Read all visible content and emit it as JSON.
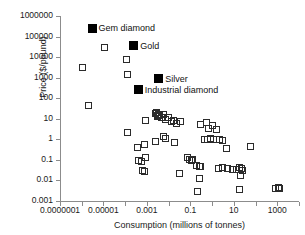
{
  "chart_data": {
    "type": "scatter",
    "title": "",
    "xlabel": "Consumption (millions of tonnes)",
    "ylabel": "Price ($/pound)",
    "xscale": "log",
    "yscale": "log",
    "xlim": [
      1e-07,
      10000
    ],
    "ylim": [
      0.001,
      1000000
    ],
    "grid": false,
    "legend": "none",
    "xticklabels": [
      "0.0000001",
      "0.00001",
      "0.001",
      "0.1",
      "10",
      "1000"
    ],
    "xtickvalues": [
      1e-07,
      1e-05,
      0.001,
      0.1,
      10,
      1000
    ],
    "yticklabels": [
      "1000000",
      "100000",
      "10000",
      "1000",
      "100",
      "10",
      "1",
      "0.1",
      "0.01",
      "0.001"
    ],
    "ytickvalues": [
      1000000,
      100000,
      10000,
      1000,
      100,
      10,
      1,
      0.1,
      0.01,
      0.001
    ],
    "annotations": [
      {
        "label": "Gem diamond",
        "x": 3e-06,
        "y": 250000
      },
      {
        "label": "Gold",
        "x": 0.00025,
        "y": 35000
      },
      {
        "label": "Silver",
        "x": 0.0035,
        "y": 900
      },
      {
        "label": "Industrial diamond",
        "x": 0.0004,
        "y": 260
      }
    ],
    "series": [
      {
        "name": "Labeled commodities",
        "marker": "filled-square",
        "points": [
          {
            "x": 3e-06,
            "y": 250000,
            "label": "Gem diamond"
          },
          {
            "x": 0.00025,
            "y": 35000,
            "label": "Gold"
          },
          {
            "x": 0.0035,
            "y": 900,
            "label": "Silver"
          },
          {
            "x": 0.0004,
            "y": 260,
            "label": "Industrial diamond"
          }
        ]
      },
      {
        "name": "Other commodities",
        "marker": "open-square",
        "points": [
          {
            "x": 1.1e-05,
            "y": 30000
          },
          {
            "x": 1.1e-06,
            "y": 3200
          },
          {
            "x": 0.00012,
            "y": 7500
          },
          {
            "x": 0.00013,
            "y": 1500
          },
          {
            "x": 2e-06,
            "y": 42
          },
          {
            "x": 0.00013,
            "y": 2.1
          },
          {
            "x": 0.00085,
            "y": 8.0
          },
          {
            "x": 0.0025,
            "y": 18
          },
          {
            "x": 0.0028,
            "y": 20
          },
          {
            "x": 0.003,
            "y": 15
          },
          {
            "x": 0.0032,
            "y": 13
          },
          {
            "x": 0.0035,
            "y": 17
          },
          {
            "x": 0.004,
            "y": 14
          },
          {
            "x": 0.0048,
            "y": 11
          },
          {
            "x": 0.006,
            "y": 16
          },
          {
            "x": 0.0075,
            "y": 9.0
          },
          {
            "x": 0.01,
            "y": 12
          },
          {
            "x": 0.013,
            "y": 7.5
          },
          {
            "x": 0.017,
            "y": 8.5
          },
          {
            "x": 0.022,
            "y": 6.0
          },
          {
            "x": 0.035,
            "y": 7.0
          },
          {
            "x": 0.3,
            "y": 5.0
          },
          {
            "x": 0.55,
            "y": 6.5
          },
          {
            "x": 0.65,
            "y": 3.2
          },
          {
            "x": 1.1,
            "y": 4.5
          },
          {
            "x": 1.6,
            "y": 3.0
          },
          {
            "x": 0.0026,
            "y": 0.75
          },
          {
            "x": 0.006,
            "y": 1.3
          },
          {
            "x": 0.0075,
            "y": 1.1
          },
          {
            "x": 0.018,
            "y": 0.7
          },
          {
            "x": 0.45,
            "y": 1.0
          },
          {
            "x": 0.6,
            "y": 0.95
          },
          {
            "x": 0.85,
            "y": 1.05
          },
          {
            "x": 1.2,
            "y": 1.0
          },
          {
            "x": 2.2,
            "y": 0.95
          },
          {
            "x": 3.0,
            "y": 0.9
          },
          {
            "x": 4.5,
            "y": 0.35
          },
          {
            "x": 0.00035,
            "y": 0.42
          },
          {
            "x": 0.0008,
            "y": 0.55
          },
          {
            "x": 0.0004,
            "y": 0.095
          },
          {
            "x": 0.00055,
            "y": 0.085
          },
          {
            "x": 0.0009,
            "y": 0.13
          },
          {
            "x": 0.0006,
            "y": 0.032
          },
          {
            "x": 0.00075,
            "y": 0.027
          },
          {
            "x": 0.03,
            "y": 0.022
          },
          {
            "x": 0.075,
            "y": 0.13
          },
          {
            "x": 0.09,
            "y": 0.1
          },
          {
            "x": 0.095,
            "y": 0.11
          },
          {
            "x": 0.11,
            "y": 0.09
          },
          {
            "x": 0.13,
            "y": 0.1
          },
          {
            "x": 0.2,
            "y": 0.055
          },
          {
            "x": 0.25,
            "y": 0.05
          },
          {
            "x": 0.3,
            "y": 0.048
          },
          {
            "x": 0.25,
            "y": 0.013
          },
          {
            "x": 0.22,
            "y": 0.0028
          },
          {
            "x": 2.0,
            "y": 0.04
          },
          {
            "x": 3.0,
            "y": 0.042
          },
          {
            "x": 5.0,
            "y": 0.038
          },
          {
            "x": 9.0,
            "y": 0.036
          },
          {
            "x": 13,
            "y": 0.033
          },
          {
            "x": 18,
            "y": 0.042
          },
          {
            "x": 22,
            "y": 0.04
          },
          {
            "x": 25,
            "y": 0.03
          },
          {
            "x": 20,
            "y": 0.018
          },
          {
            "x": 18,
            "y": 0.0037
          },
          {
            "x": 60,
            "y": 0.45
          },
          {
            "x": 800,
            "y": 0.0042
          },
          {
            "x": 1100,
            "y": 0.0045
          },
          {
            "x": 1300,
            "y": 0.004
          }
        ]
      }
    ]
  }
}
